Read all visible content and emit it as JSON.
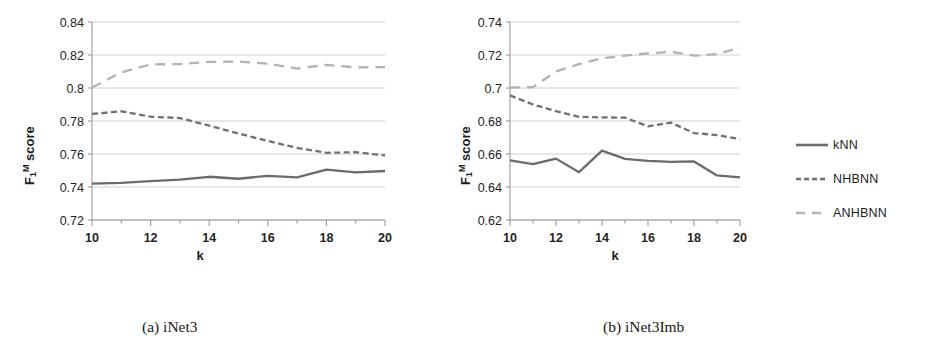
{
  "figure": {
    "background": "#ffffff",
    "captions": {
      "a": "(a) iNet3",
      "b": "(b) iNet3Imb"
    }
  },
  "legend": {
    "position": "right",
    "items": [
      {
        "label": "kNN",
        "style": "solid",
        "color": "#6b6b6b"
      },
      {
        "label": "NHBNN",
        "style": "dashed",
        "color": "#707070"
      },
      {
        "label": "ANHBNN",
        "style": "longdashed",
        "color": "#b2b2b2"
      }
    ]
  },
  "chart_data": [
    {
      "type": "line",
      "title": "(a) iNet3",
      "xlabel": "k",
      "ylabel": "F₁ᴹ score",
      "ylabel_parts": {
        "base": "F",
        "sub": "1",
        "sup": "M",
        "tail": " score"
      },
      "x": [
        10,
        11,
        12,
        13,
        14,
        15,
        16,
        17,
        18,
        19,
        20
      ],
      "xlim": [
        10,
        20
      ],
      "ylim": [
        0.72,
        0.84
      ],
      "xticks": [
        10,
        11,
        12,
        13,
        14,
        15,
        16,
        17,
        18,
        19,
        20
      ],
      "xtick_labels": [
        "10",
        "",
        "12",
        "",
        "14",
        "",
        "16",
        "",
        "18",
        "",
        "20"
      ],
      "yticks": [
        0.72,
        0.74,
        0.76,
        0.78,
        0.8,
        0.82,
        0.84
      ],
      "ytick_labels": [
        "0.72",
        "0.74",
        "0.76",
        "0.78",
        "0.8",
        "0.82",
        "0.84"
      ],
      "grid": true,
      "series": [
        {
          "name": "kNN",
          "style": "solid",
          "color": "#6b6b6b",
          "values": [
            0.7421,
            0.7425,
            0.7435,
            0.7445,
            0.7462,
            0.745,
            0.7468,
            0.7458,
            0.7505,
            0.7489,
            0.7497
          ]
        },
        {
          "name": "NHBNN",
          "style": "dashed",
          "color": "#707070",
          "values": [
            0.7843,
            0.7859,
            0.7826,
            0.7818,
            0.7772,
            0.7724,
            0.7679,
            0.7637,
            0.7607,
            0.7611,
            0.7591
          ]
        },
        {
          "name": "ANHBNN",
          "style": "longdashed",
          "color": "#b2b2b2",
          "values": [
            0.8003,
            0.8095,
            0.8143,
            0.8145,
            0.8158,
            0.816,
            0.8148,
            0.8118,
            0.814,
            0.8125,
            0.8127
          ]
        }
      ]
    },
    {
      "type": "line",
      "title": "(b) iNet3Imb",
      "xlabel": "k",
      "ylabel": "F₁ᴹ score",
      "ylabel_parts": {
        "base": "F",
        "sub": "1",
        "sup": "M",
        "tail": " score"
      },
      "x": [
        10,
        11,
        12,
        13,
        14,
        15,
        16,
        17,
        18,
        19,
        20
      ],
      "xlim": [
        10,
        20
      ],
      "ylim": [
        0.62,
        0.74
      ],
      "xticks": [
        10,
        11,
        12,
        13,
        14,
        15,
        16,
        17,
        18,
        19,
        20
      ],
      "xtick_labels": [
        "10",
        "",
        "12",
        "",
        "14",
        "",
        "16",
        "",
        "18",
        "",
        "20"
      ],
      "yticks": [
        0.62,
        0.64,
        0.66,
        0.68,
        0.7,
        0.72,
        0.74
      ],
      "ytick_labels": [
        "0.62",
        "0.64",
        "0.66",
        "0.68",
        "0.7",
        "0.72",
        "0.74"
      ],
      "grid": true,
      "series": [
        {
          "name": "kNN",
          "style": "solid",
          "color": "#6b6b6b",
          "values": [
            0.6562,
            0.6538,
            0.6572,
            0.649,
            0.662,
            0.657,
            0.6558,
            0.6552,
            0.6555,
            0.647,
            0.6458
          ]
        },
        {
          "name": "NHBNN",
          "style": "dashed",
          "color": "#707070",
          "values": [
            0.6955,
            0.69,
            0.686,
            0.6825,
            0.6822,
            0.682,
            0.6768,
            0.679,
            0.6727,
            0.6715,
            0.669
          ]
        },
        {
          "name": "ANHBNN",
          "style": "longdashed",
          "color": "#b2b2b2",
          "values": [
            0.7003,
            0.7005,
            0.71,
            0.7145,
            0.718,
            0.7196,
            0.721,
            0.722,
            0.7196,
            0.7205,
            0.7245
          ]
        }
      ]
    }
  ]
}
